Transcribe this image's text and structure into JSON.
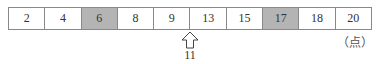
{
  "cells": [
    {
      "value": "2",
      "shaded": false
    },
    {
      "value": "4",
      "shaded": false
    },
    {
      "value": "6",
      "shaded": true
    },
    {
      "value": "8",
      "shaded": false
    },
    {
      "value": "9",
      "shaded": false
    },
    {
      "value": "13",
      "shaded": false
    },
    {
      "value": "15",
      "shaded": false
    },
    {
      "value": "17",
      "shaded": true
    },
    {
      "value": "18",
      "shaded": false
    },
    {
      "value": "20",
      "shaded": false
    }
  ],
  "unit": "（点）",
  "arrow": {
    "label": "11",
    "position": "between 9 and 13"
  },
  "colors": {
    "shaded": "#b4b4b4",
    "border": "#888888"
  }
}
